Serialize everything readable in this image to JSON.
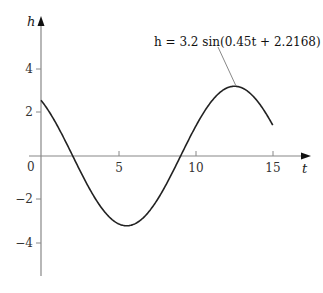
{
  "chart_data": {
    "type": "line",
    "title": "",
    "xlabel": "t",
    "ylabel": "h",
    "xlim": [
      0,
      17
    ],
    "ylim": [
      -5.5,
      6.3
    ],
    "x_ticks": [
      5,
      10,
      15
    ],
    "x_tick_labels": [
      "5",
      "10",
      "15"
    ],
    "y_ticks": [
      4,
      2,
      -2,
      -4
    ],
    "y_tick_labels": [
      "4",
      "2",
      "−2",
      "−4"
    ],
    "origin_label": "0",
    "grid": false,
    "legend": null,
    "annotations": [
      {
        "text": "h = 3.2 sin(0.45t + 2.2168)",
        "points_to": {
          "t": 12.5,
          "h": 3.2
        }
      }
    ],
    "series": [
      {
        "name": "h = 3.2 sin(0.45t + 2.2168)",
        "function": "3.2*sin(0.45*t+2.2168)",
        "amplitude": 3.2,
        "angular_frequency": 0.45,
        "phase": 2.2168,
        "t_range": [
          0,
          15
        ],
        "x": [
          0,
          1,
          2,
          3,
          4,
          5,
          6,
          7,
          8,
          9,
          10,
          11,
          12,
          13,
          14,
          15
        ],
        "values": [
          2.56,
          1.36,
          -0.17,
          -1.67,
          -2.8,
          -3.18,
          -2.9,
          -2.02,
          -0.68,
          0.8,
          2.14,
          2.99,
          3.2,
          2.7,
          1.63,
          0.21
        ]
      }
    ]
  },
  "labels": {
    "x_axis": "t",
    "y_axis": "h",
    "origin": "0",
    "equation": "h = 3.2 sin(0.45t + 2.2168)",
    "x_ticks": [
      "5",
      "10",
      "15"
    ],
    "y_ticks": [
      "4",
      "2",
      "−2",
      "−4"
    ]
  }
}
